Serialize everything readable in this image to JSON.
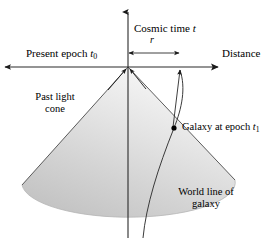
{
  "figure": {
    "title_fragment": "",
    "axes": {
      "vertical": {
        "label": "Cosmic time",
        "symbol": "t",
        "direction": "up",
        "x": 128,
        "top_y": 12,
        "bottom_y": 238
      },
      "horizontal": {
        "left_label": "Present epoch",
        "left_symbol": "t",
        "left_subscript": "0",
        "right_label": "Distance",
        "y": 67,
        "left_x": 5,
        "right_x": 218,
        "arrows": "both"
      }
    },
    "measure": {
      "symbol": "r",
      "from_x": 128,
      "to_x": 180,
      "y": 53,
      "arrows": "both"
    },
    "light_cone": {
      "label_line1": "Past light",
      "label_line2": "cone",
      "apex_x": 128,
      "apex_y": 67,
      "left_edge_x": 22,
      "left_edge_y": 185,
      "right_edge_x": 235,
      "right_edge_y": 180,
      "ellipse_bottom_y": 206,
      "fill_light": "#f2f2f2",
      "fill_dark": "#c9c9c9",
      "stroke": "#4a4a4a"
    },
    "galaxy": {
      "label": "Galaxy at epoch",
      "symbol": "t",
      "subscript": "1",
      "marker_x": 174,
      "marker_y": 128,
      "marker_color": "#000000"
    },
    "world_line": {
      "label_line1": "World line of",
      "label_line2": "galaxy",
      "stroke": "#3a3a3a"
    },
    "light_ray_arrows": {
      "count": 2,
      "target": "apex",
      "description": "two arrowheads converging upward at cone apex"
    },
    "galaxy_ray": {
      "from_x": 174,
      "from_y": 128,
      "to_x": 180,
      "to_y": 70,
      "arrow": "up"
    }
  }
}
